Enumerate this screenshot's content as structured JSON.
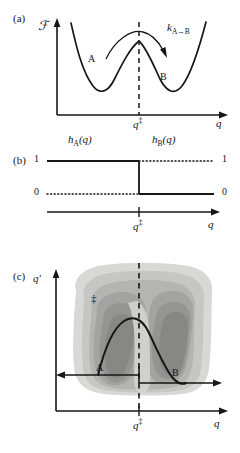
{
  "figure": {
    "type": "three-panel scientific diagram",
    "panels": [
      {
        "tag": "(a)",
        "description": "free energy profile along reaction coordinate"
      },
      {
        "tag": "(b)",
        "description": "indicator step functions"
      },
      {
        "tag": "(c)",
        "description": "two-dimensional free energy contour map"
      }
    ]
  },
  "panel_a": {
    "tag": "(a)",
    "y_axis_label": "ℱ",
    "x_axis_label": "q",
    "barrier_tick_label": "q",
    "barrier_tick_sup": "‡",
    "well_left_label": "A",
    "well_right_label": "B",
    "rate_label": "k",
    "rate_sub": "A→B"
  },
  "panel_b": {
    "tag": "(b)",
    "left_func_label": "h",
    "left_func_sub": "A",
    "left_func_arg": "(q)",
    "right_func_label": "h",
    "right_func_sub": "B",
    "right_func_arg": "(q)",
    "y_top_left": "1",
    "y_bottom_left": "0",
    "y_top_right": "1",
    "y_bottom_right": "0",
    "x_axis_label": "q",
    "barrier_tick_label": "q",
    "barrier_tick_sup": "‡"
  },
  "panel_c": {
    "tag": "(c)",
    "y_axis_label": "q",
    "y_axis_prime": "′",
    "x_axis_label": "q",
    "barrier_tick_label": "q",
    "barrier_tick_sup": "‡",
    "basin_left_label": "A",
    "basin_right_label": "B",
    "saddle_label": "‡"
  },
  "colors": {
    "ink": "#161616",
    "contour_l1": "#d5d5d3",
    "contour_l2": "#c3c3c1",
    "contour_l3": "#b2b2b0",
    "contour_l4": "#a2a2a0",
    "contour_l5": "#949492",
    "contour_l6": "#878785",
    "background": "#ffffff"
  }
}
